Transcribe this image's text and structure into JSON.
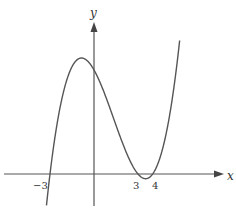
{
  "chart_data": {
    "type": "line",
    "title": "",
    "xlabel": "x",
    "ylabel": "y",
    "tick_labels": [
      "-3",
      "3",
      "4"
    ],
    "roots": [
      -3,
      3,
      4
    ],
    "grid": false,
    "legend": null,
    "series": [
      {
        "name": "f(x)",
        "function": "(x+3)(x-3)(x-4)",
        "x_range": [
          -3.3,
          5.8
        ]
      }
    ]
  },
  "labels": {
    "x_axis": "x",
    "y_axis": "y",
    "tick_neg3": "−3",
    "tick_3": "3",
    "tick_4": "4"
  },
  "colors": {
    "curve": "#555555",
    "axes": "#555555",
    "text": "#333333"
  }
}
